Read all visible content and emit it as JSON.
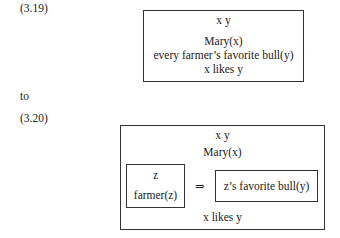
{
  "example1": {
    "label": "(3.19)",
    "drs": {
      "universe": "x  y",
      "conditions": [
        "Mary(x)",
        "every farmer’s favorite bull(y)",
        "x likes y"
      ]
    }
  },
  "connector": "to",
  "example2": {
    "label": "(3.20)",
    "drs": {
      "universe": "x  y",
      "conditions": [
        "Mary(x)",
        "x likes y"
      ],
      "implication": {
        "antecedent": {
          "universe": "z",
          "conditions": [
            "farmer(z)"
          ]
        },
        "arrow": "⇒",
        "consequent": {
          "conditions": [
            "z’s favorite bull(y)"
          ]
        }
      }
    }
  }
}
